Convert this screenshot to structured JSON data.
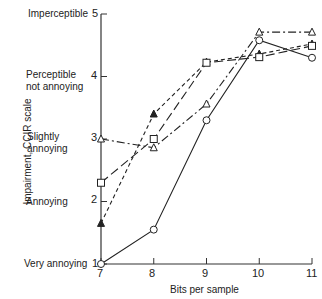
{
  "chart_data": {
    "type": "line",
    "title": "",
    "xlabel": "Bits per sample",
    "ylabel": "Impairment, CCIR scale",
    "x": [
      7,
      8,
      9,
      10,
      11
    ],
    "xlim": [
      7,
      11
    ],
    "ylim": [
      1,
      5
    ],
    "x_ticks": [
      "7",
      "8",
      "9",
      "10",
      "11"
    ],
    "y_ticks": [
      "1",
      "2",
      "3",
      "4",
      "5"
    ],
    "y_tick_descriptions": {
      "5": "Imperceptible",
      "4": "Perceptible not annoying",
      "3": "Slightly annoying",
      "2": "Annoying",
      "1": "Very annoying"
    },
    "grid": false,
    "legend": null,
    "series": [
      {
        "name": "open circle (solid)",
        "marker": "circle-open",
        "line": "solid",
        "values": [
          1.0,
          1.55,
          3.3,
          4.58,
          4.3
        ]
      },
      {
        "name": "filled triangle (short dash)",
        "marker": "triangle-filled",
        "line": "dashed",
        "values": [
          1.65,
          3.4,
          4.23,
          4.36,
          4.52
        ]
      },
      {
        "name": "open square (long dash)",
        "marker": "square-open",
        "line": "long-dash",
        "values": [
          2.3,
          3.0,
          4.22,
          4.31,
          4.49
        ]
      },
      {
        "name": "open triangle (dash-dot)",
        "marker": "triangle-open",
        "line": "dash-dot",
        "values": [
          3.0,
          2.86,
          3.56,
          4.71,
          4.71
        ]
      }
    ]
  },
  "labels": {
    "y5": "Imperceptible",
    "y4a": "Perceptible",
    "y4b": "not annoying",
    "y3a": "Slightly",
    "y3b": "annoying",
    "y2": "Annoying",
    "y1": "Very annoying",
    "xlabel": "Bits per sample",
    "ylabel": "Impairment, CCIR scale",
    "t1": "1",
    "t2": "2",
    "t3": "3",
    "t4": "4",
    "t5": "5",
    "x7": "7",
    "x8": "8",
    "x9": "9",
    "x10": "10",
    "x11": "11"
  }
}
